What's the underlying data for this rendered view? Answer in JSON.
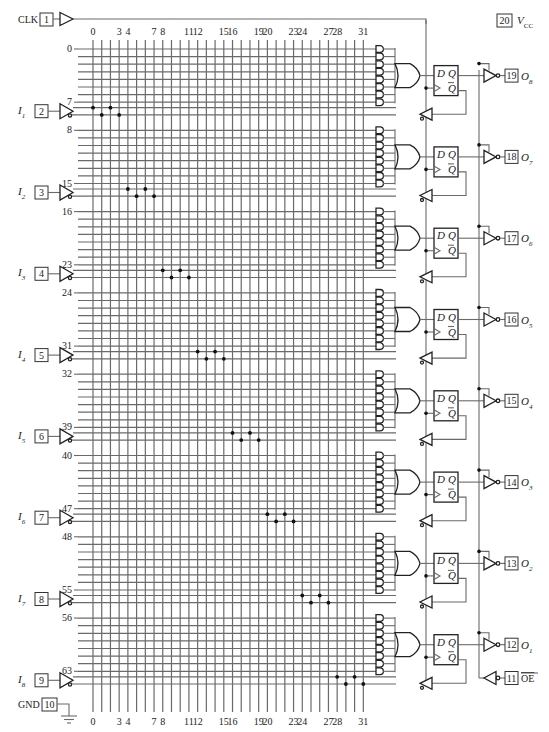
{
  "diagram": {
    "vcc": {
      "pin": "20",
      "label": "V",
      "sub": "CC"
    },
    "clk": {
      "pin": "1",
      "label": "CLK"
    },
    "gnd": {
      "pin": "10",
      "label": "GND"
    },
    "oe": {
      "pin": "11",
      "label": "OE"
    },
    "column_labels": [
      {
        "col": 0,
        "text": "0"
      },
      {
        "col": 3,
        "text": "3"
      },
      {
        "col": 4,
        "text": "4"
      },
      {
        "col": 7,
        "text": "7"
      },
      {
        "col": 8,
        "text": "8"
      },
      {
        "col": 11,
        "text": "11"
      },
      {
        "col": 12,
        "text": "12"
      },
      {
        "col": 15,
        "text": "15"
      },
      {
        "col": 16,
        "text": "16"
      },
      {
        "col": 19,
        "text": "19"
      },
      {
        "col": 20,
        "text": "20"
      },
      {
        "col": 23,
        "text": "23"
      },
      {
        "col": 24,
        "text": "24"
      },
      {
        "col": 27,
        "text": "27"
      },
      {
        "col": 28,
        "text": "28"
      },
      {
        "col": 31,
        "text": "31"
      }
    ],
    "inputs": [
      {
        "name": "I",
        "sub": "1",
        "pin": "2",
        "row_top": "7",
        "row_bottom": "8"
      },
      {
        "name": "I",
        "sub": "2",
        "pin": "3",
        "row_top": "15",
        "row_bottom": "16"
      },
      {
        "name": "I",
        "sub": "3",
        "pin": "4",
        "row_top": "23",
        "row_bottom": "24"
      },
      {
        "name": "I",
        "sub": "4",
        "pin": "5",
        "row_top": "31",
        "row_bottom": "32"
      },
      {
        "name": "I",
        "sub": "5",
        "pin": "6",
        "row_top": "39",
        "row_bottom": "40"
      },
      {
        "name": "I",
        "sub": "6",
        "pin": "7",
        "row_top": "47",
        "row_bottom": "48"
      },
      {
        "name": "I",
        "sub": "7",
        "pin": "8",
        "row_top": "55",
        "row_bottom": "56"
      },
      {
        "name": "I",
        "sub": "8",
        "pin": "9",
        "row_top": "63",
        "row_bottom": ""
      }
    ],
    "first_row_label": "0",
    "outputs": [
      {
        "name": "O",
        "sub": "8",
        "pin": "19"
      },
      {
        "name": "O",
        "sub": "7",
        "pin": "18"
      },
      {
        "name": "O",
        "sub": "6",
        "pin": "17"
      },
      {
        "name": "O",
        "sub": "5",
        "pin": "16"
      },
      {
        "name": "O",
        "sub": "4",
        "pin": "15"
      },
      {
        "name": "O",
        "sub": "3",
        "pin": "14"
      },
      {
        "name": "O",
        "sub": "2",
        "pin": "13"
      },
      {
        "name": "O",
        "sub": "1",
        "pin": "12"
      }
    ],
    "flipflop": {
      "d": "D",
      "q": "Q",
      "qbar": "Q"
    },
    "product_terms_per_output": 8,
    "input_columns": 32
  }
}
